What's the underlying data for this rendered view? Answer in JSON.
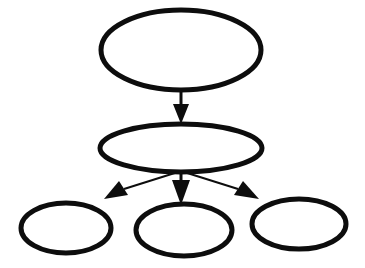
{
  "figure": {
    "title": "",
    "kind": "tree-diagram",
    "background_color": "#ffffff",
    "stroke_color": "#0d0d0d",
    "fill_color": "#ffffff",
    "width": 365,
    "height": 268
  },
  "nodes": [
    {
      "id": "root",
      "label": "",
      "role": "root",
      "cx": 181,
      "cy": 50,
      "rx": 80,
      "ry": 40,
      "stroke_width": 5
    },
    {
      "id": "mid",
      "label": "",
      "role": "internal",
      "cx": 181,
      "cy": 148,
      "rx": 81,
      "ry": 24,
      "stroke_width": 5
    },
    {
      "id": "leaf-left",
      "label": "",
      "role": "leaf",
      "cx": 66,
      "cy": 228,
      "rx": 45,
      "ry": 25,
      "stroke_width": 5
    },
    {
      "id": "leaf-middle",
      "label": "",
      "role": "leaf",
      "cx": 184,
      "cy": 230,
      "rx": 48,
      "ry": 26,
      "stroke_width": 5
    },
    {
      "id": "leaf-right",
      "label": "",
      "role": "leaf",
      "cx": 299,
      "cy": 224,
      "rx": 47,
      "ry": 25,
      "stroke_width": 5
    }
  ],
  "edges": [
    {
      "id": "root-to-mid",
      "from": "root",
      "to": "mid",
      "label": "",
      "shaft": {
        "x1": 181,
        "y1": 90,
        "x2": 181,
        "y2": 104
      },
      "head": "173,104 189,104 181,124",
      "stroke_width": 3
    },
    {
      "id": "mid-to-leaf-left",
      "from": "mid",
      "to": "leaf-left",
      "label": "",
      "shaft": {
        "x1": 178,
        "y1": 172,
        "x2": 124,
        "y2": 189
      },
      "head": "104,199 119,181 128,195",
      "stroke_width": 2
    },
    {
      "id": "mid-to-leaf-middle",
      "from": "mid",
      "to": "leaf-middle",
      "label": "",
      "shaft": {
        "x1": 181,
        "y1": 172,
        "x2": 181,
        "y2": 180
      },
      "head": "172,180 190,180 181,205",
      "stroke_width": 3
    },
    {
      "id": "mid-to-leaf-right",
      "from": "mid",
      "to": "leaf-right",
      "label": "",
      "shaft": {
        "x1": 184,
        "y1": 172,
        "x2": 238,
        "y2": 189
      },
      "head": "259,199 243,181 234,195",
      "stroke_width": 2
    }
  ]
}
